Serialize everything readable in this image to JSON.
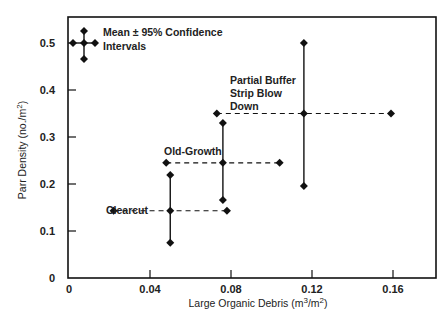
{
  "chart_data": {
    "type": "scatter",
    "title": "",
    "xlabel": "Large Organic Debris (m3/m2)",
    "xlabel_parts": {
      "pre": "Large Organic Debris (m",
      "sup1": "3",
      "mid": "/m",
      "sup2": "2",
      "post": ")"
    },
    "ylabel": "Parr Density (no./m2)",
    "ylabel_parts": {
      "pre": "Parr Density (no./m",
      "sup": "2",
      "post": ")"
    },
    "xlim": [
      0,
      0.18
    ],
    "ylim": [
      0,
      0.55
    ],
    "x_ticks": [
      0,
      0.04,
      0.08,
      0.12,
      0.16
    ],
    "x_tick_labels": [
      "0",
      "0.04",
      "0.08",
      "0.12",
      "0.16"
    ],
    "y_ticks": [
      0,
      0.1,
      0.2,
      0.3,
      0.4,
      0.5
    ],
    "y_tick_labels": [
      "0",
      "0.1",
      "0.2",
      "0.3",
      "0.4",
      "0.5"
    ],
    "grid": false,
    "legend": {
      "position": "top-left",
      "text_line1": "Mean ± 95% Confidence",
      "text_line2": "Intervals"
    },
    "series": [
      {
        "name": "Clearcut",
        "x_mean": 0.05,
        "x_low": 0.022,
        "x_high": 0.078,
        "y_mean": 0.143,
        "y_low": 0.075,
        "y_high": 0.219
      },
      {
        "name": "Old-Growth",
        "x_mean": 0.076,
        "x_low": 0.048,
        "x_high": 0.104,
        "y_mean": 0.245,
        "y_low": 0.166,
        "y_high": 0.33
      },
      {
        "name": "Partial Buffer Strip Blow Down",
        "label_lines": [
          "Partial Buffer",
          "Strip Blow",
          "Down"
        ],
        "x_mean": 0.116,
        "x_low": 0.073,
        "x_high": 0.159,
        "y_mean": 0.35,
        "y_low": 0.196,
        "y_high": 0.5
      }
    ]
  }
}
